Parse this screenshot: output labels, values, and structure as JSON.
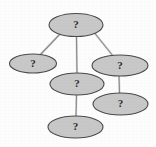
{
  "diagram": {
    "background_color": "#fdfdfd",
    "node_fill_color": "#c8c8c8",
    "node_stroke_color": "#4a4a4a",
    "edge_color": "#8a8a8a",
    "label_color": "#2b2b2b",
    "node_count": 6,
    "edge_count": 5,
    "nodes": [
      {
        "id": "n1",
        "label": "?",
        "cx": 76,
        "cy": 25,
        "rx": 27,
        "ry": 11.5,
        "role": "root"
      },
      {
        "id": "n2",
        "label": "?",
        "cx": 33,
        "cy": 63.5,
        "rx": 23.5,
        "ry": 9.5,
        "role": "child-left"
      },
      {
        "id": "n3",
        "label": "?",
        "cx": 120,
        "cy": 65.5,
        "rx": 28,
        "ry": 10.5,
        "role": "child-right"
      },
      {
        "id": "n4",
        "label": "?",
        "cx": 77,
        "cy": 84,
        "rx": 27,
        "ry": 11,
        "role": "child-center"
      },
      {
        "id": "n5",
        "label": "?",
        "cx": 120.5,
        "cy": 104,
        "rx": 27.5,
        "ry": 11,
        "role": "grandchild-right"
      },
      {
        "id": "n6",
        "label": "?",
        "cx": 75.5,
        "cy": 127,
        "rx": 27.5,
        "ry": 11,
        "role": "grandchild-center"
      }
    ],
    "edges": [
      {
        "id": "e1",
        "from": "n1",
        "to": "n2",
        "x1": 60,
        "y1": 34,
        "x2": 40,
        "y2": 55
      },
      {
        "id": "e2",
        "from": "n1",
        "to": "n4",
        "x1": 76.5,
        "y1": 36.5,
        "x2": 77,
        "y2": 73
      },
      {
        "id": "e3",
        "from": "n1",
        "to": "n3",
        "x1": 95,
        "y1": 33.5,
        "x2": 113,
        "y2": 56
      },
      {
        "id": "e4",
        "from": "n3",
        "to": "n5",
        "x1": 119,
        "y1": 76,
        "x2": 119.5,
        "y2": 93.5
      },
      {
        "id": "e5",
        "from": "n4",
        "to": "n6",
        "x1": 76.5,
        "y1": 95,
        "x2": 76,
        "y2": 116
      }
    ]
  }
}
